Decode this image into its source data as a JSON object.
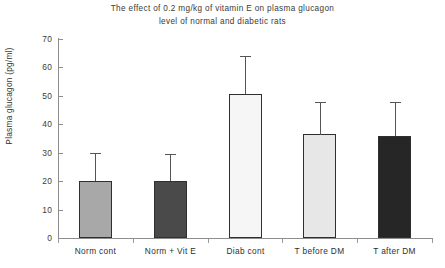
{
  "chart_data": {
    "type": "bar",
    "title": "The effect of 0.2 mg/kg of vitamin E on plasma glucagon level of normal and diabetic rats",
    "title_lines": [
      "The effect of 0.2 mg/kg of vitamin E on plasma glucagon",
      "level of normal and diabetic rats"
    ],
    "xlabel": "",
    "ylabel": "Plasma glucagon (pg/ml)",
    "ylim": [
      0,
      70
    ],
    "ytick_step": 10,
    "yticks": [
      0,
      10,
      20,
      30,
      40,
      50,
      60,
      70
    ],
    "ytick_labels": [
      "0",
      "10",
      "20",
      "30",
      "40",
      "50",
      "60",
      "70"
    ],
    "grid": false,
    "legend": false,
    "error_bars": "upper-only",
    "categories": [
      "Norm cont",
      "Norm + Vit E",
      "Diab cont",
      "T before DM",
      "T after DM"
    ],
    "values": [
      20,
      20,
      50.5,
      36.5,
      36
    ],
    "errors": [
      10,
      9.5,
      13.5,
      11.5,
      12
    ],
    "error_tops": [
      30,
      29.5,
      64,
      48,
      48
    ],
    "bar_colors": [
      "#a8a8a8",
      "#4a4a4a",
      "#f6f6f6",
      "#e7e7e7",
      "#262626"
    ],
    "bar_edge_color": "#2f2f2f",
    "axis_color": "#8d8d8d",
    "background_color": "#ffffff",
    "bars": [
      {
        "category": "Norm cont",
        "value": 20,
        "error": 10,
        "error_top": 30,
        "color": "#a8a8a8"
      },
      {
        "category": "Norm + Vit E",
        "value": 20,
        "error": 9.5,
        "error_top": 29.5,
        "color": "#4a4a4a"
      },
      {
        "category": "Diab cont",
        "value": 50.5,
        "error": 13.5,
        "error_top": 64,
        "color": "#f6f6f6"
      },
      {
        "category": "T before DM",
        "value": 36.5,
        "error": 11.5,
        "error_top": 48,
        "color": "#e7e7e7"
      },
      {
        "category": "T after DM",
        "value": 36,
        "error": 12,
        "error_top": 48,
        "color": "#262626"
      }
    ]
  }
}
